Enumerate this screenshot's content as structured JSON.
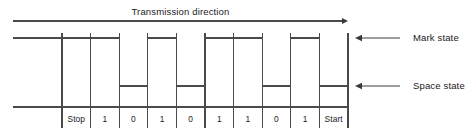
{
  "diagram": {
    "title": "Transmission direction",
    "labels": {
      "mark": "Mark state",
      "space": "Space state"
    },
    "bits": [
      {
        "label": "Stop",
        "state": "mark"
      },
      {
        "label": "1",
        "state": "mark"
      },
      {
        "label": "0",
        "state": "space"
      },
      {
        "label": "1",
        "state": "mark"
      },
      {
        "label": "0",
        "state": "space"
      },
      {
        "label": "1",
        "state": "mark"
      },
      {
        "label": "1",
        "state": "mark"
      },
      {
        "label": "0",
        "state": "space"
      },
      {
        "label": "1",
        "state": "mark"
      },
      {
        "label": "Start",
        "state": "space"
      }
    ],
    "colors": {
      "line": "#4a4a4a",
      "text": "#1a1a1a",
      "background": "#ffffff"
    },
    "geometry": {
      "plot_left": 13,
      "cells_left": 62,
      "cells_right": 348,
      "arrow_y": 21,
      "mark_y": 38,
      "space_y": 86,
      "baseline_y": 107,
      "label_row_bottom": 128,
      "callout_text_x": 413,
      "callout_arrow_tip_x": 355,
      "callout_arrow_tail_x": 400
    }
  }
}
